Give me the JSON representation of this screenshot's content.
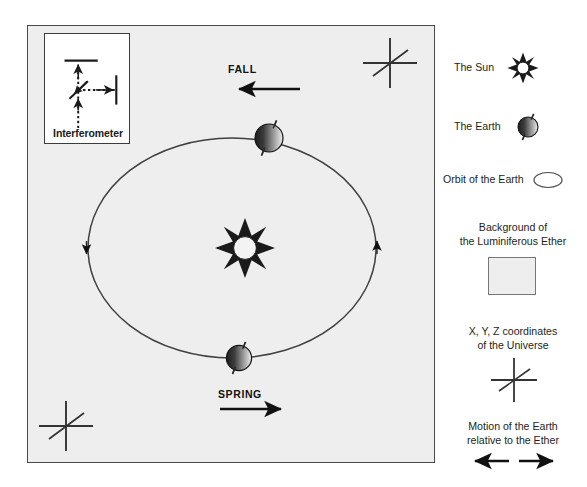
{
  "diagram": {
    "panel": {
      "name": "ether-background-panel",
      "fill_color": "#d9d9d9",
      "border_color": "#4a4a4a"
    },
    "inset": {
      "label": "Interferometer",
      "background": "#ffffff",
      "border_color": "#3c3c3c"
    },
    "season_labels": {
      "fall": "FALL",
      "spring": "SPRING"
    },
    "arrows": {
      "fall_direction": "left",
      "spring_direction": "right"
    },
    "orbit": {
      "direction": "clockwise",
      "arrow_left": "down",
      "arrow_right": "up",
      "stroke_color": "#3a3a3a"
    },
    "bodies": [
      {
        "name": "sun",
        "position": "center",
        "points": 8,
        "color": "#1f1f1f"
      },
      {
        "name": "earth-fall",
        "position": "top-of-orbit",
        "color_dark": "#2e2e2e",
        "color_light": "#cfcfcf"
      },
      {
        "name": "earth-spring",
        "position": "bottom-of-orbit",
        "color_dark": "#2e2e2e",
        "color_light": "#cfcfcf"
      }
    ],
    "coordinate_crosses": [
      {
        "name": "coord-cross-top-right"
      },
      {
        "name": "coord-cross-bottom-left"
      }
    ]
  },
  "legend": {
    "sun": "The Sun",
    "earth": "The Earth",
    "orbit": "Orbit of the Earth",
    "ether_line1": "Background of",
    "ether_line2": "the Luminiferous Ether",
    "coordinates_line1": "X, Y, Z coordinates",
    "coordinates_line2": "of the Universe",
    "motion_line1": "Motion of the Earth",
    "motion_line2": "relative to the Ether"
  }
}
